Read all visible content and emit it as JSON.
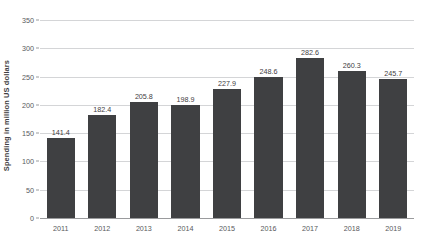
{
  "chart_data": {
    "type": "bar",
    "title": "",
    "xlabel": "",
    "ylabel": "Spending in million US dollars",
    "categories": [
      "2011",
      "2012",
      "2013",
      "2014",
      "2015",
      "2016",
      "2017",
      "2018",
      "2019"
    ],
    "values": [
      141.4,
      182.4,
      205.8,
      198.9,
      227.9,
      248.6,
      282.6,
      260.3,
      245.7
    ],
    "value_labels": [
      "141.4",
      "182.4",
      "205.8",
      "198.9",
      "227.9",
      "248.6",
      "282.6",
      "260.3",
      "245.7"
    ],
    "ylim": [
      0,
      350
    ],
    "y_ticks": [
      0,
      50,
      100,
      150,
      200,
      250,
      300,
      350
    ],
    "y_tick_labels": [
      "0",
      "50",
      "100",
      "150",
      "200",
      "250",
      "300",
      "350"
    ],
    "grid": true,
    "legend": null,
    "bar_color": "#3f4042",
    "gridline_color": "#d4d5d7",
    "axis_color": "#9a9b9d",
    "background_color": "#ffffff"
  }
}
